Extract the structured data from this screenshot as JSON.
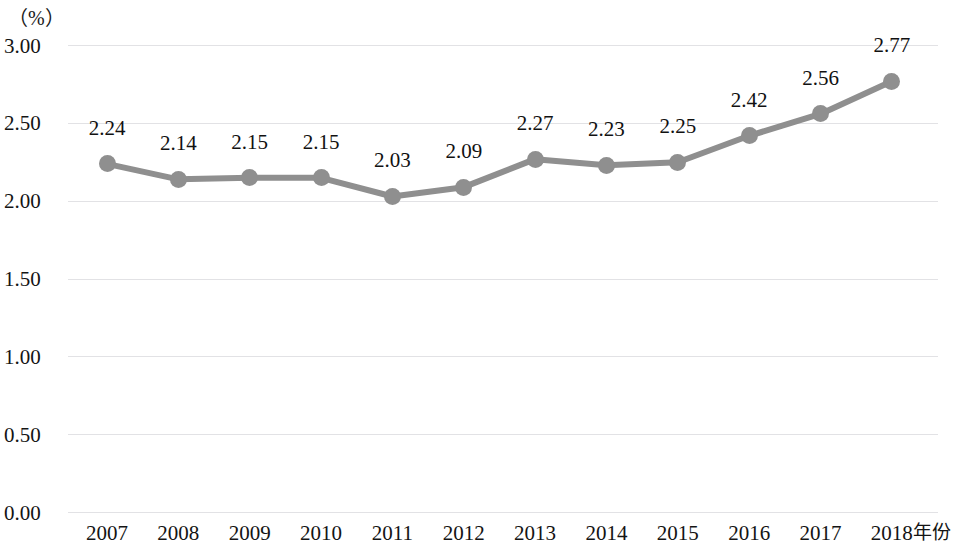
{
  "chart_data": {
    "type": "line",
    "title": "",
    "subtitle": "",
    "xlabel": "年份",
    "ylabel": "（%）",
    "unit_label": "（%）",
    "categories": [
      "2007",
      "2008",
      "2009",
      "2010",
      "2011",
      "2012",
      "2013",
      "2014",
      "2015",
      "2016",
      "2017",
      "2018"
    ],
    "values": [
      2.24,
      2.14,
      2.15,
      2.15,
      2.03,
      2.09,
      2.27,
      2.23,
      2.25,
      2.42,
      2.56,
      2.77
    ],
    "point_labels": [
      "2.24",
      "2.14",
      "2.15",
      "2.15",
      "2.03",
      "2.09",
      "2.27",
      "2.23",
      "2.25",
      "2.42",
      "2.56",
      "2.77"
    ],
    "ylim": [
      0.0,
      3.0
    ],
    "ytick_labels": [
      "0.00",
      "0.50",
      "1.00",
      "1.50",
      "2.00",
      "2.50",
      "3.00"
    ],
    "ytick_values": [
      0.0,
      0.5,
      1.0,
      1.5,
      2.0,
      2.5,
      3.0
    ],
    "grid": true,
    "grid_axis": "y",
    "legend": "none",
    "show_data_labels": true,
    "series_color": "#8f8f8f",
    "marker_color": "#8f8f8f",
    "grid_color": "#e2e2e5",
    "text_color": "#141414",
    "background_color": "#ffffff"
  }
}
